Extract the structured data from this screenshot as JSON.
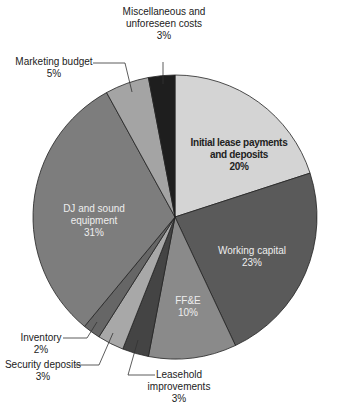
{
  "chart_data": {
    "type": "pie",
    "title": "",
    "start_angle_deg": 0,
    "direction": "clockwise",
    "slices": [
      {
        "label": "Initial lease payments and deposits",
        "value": 20,
        "pct": "20%",
        "color": "#d4d4d4"
      },
      {
        "label": "Working capital",
        "value": 23,
        "pct": "23%",
        "color": "#5a5a5a"
      },
      {
        "label": "FF&E",
        "value": 10,
        "pct": "10%",
        "color": "#8a8a8a"
      },
      {
        "label": "Leasehold improvements",
        "value": 3,
        "pct": "3%",
        "color": "#444444"
      },
      {
        "label": "Security deposits",
        "value": 3,
        "pct": "3%",
        "color": "#a8a8a8"
      },
      {
        "label": "Inventory",
        "value": 2,
        "pct": "2%",
        "color": "#666666"
      },
      {
        "label": "DJ and sound equipment",
        "value": 31,
        "pct": "31%",
        "color": "#7d7d7d"
      },
      {
        "label": "Marketing budget",
        "value": 5,
        "pct": "5%",
        "color": "#a4a4a4"
      },
      {
        "label": "Miscellaneous and unforeseen costs",
        "value": 3,
        "pct": "3%",
        "color": "#1e1e1e"
      }
    ]
  },
  "labels": {
    "lease": {
      "line1": "Initial lease payments",
      "line2": "and deposits",
      "pct": "20%"
    },
    "working": {
      "line1": "Working capital",
      "pct": "23%"
    },
    "ffe": {
      "line1": "FF&E",
      "pct": "10%"
    },
    "leasehold": {
      "line1": "Leasehold",
      "line2": "improvements",
      "pct": "3%"
    },
    "security": {
      "line1": "Security deposits",
      "pct": "3%"
    },
    "inventory": {
      "line1": "Inventory",
      "pct": "2%"
    },
    "dj": {
      "line1": "DJ and sound",
      "line2": "equipment",
      "pct": "31%"
    },
    "marketing": {
      "line1": "Marketing budget",
      "pct": "5%"
    },
    "misc": {
      "line1": "Miscellaneous and",
      "line2": "unforeseen costs",
      "pct": "3%"
    }
  }
}
